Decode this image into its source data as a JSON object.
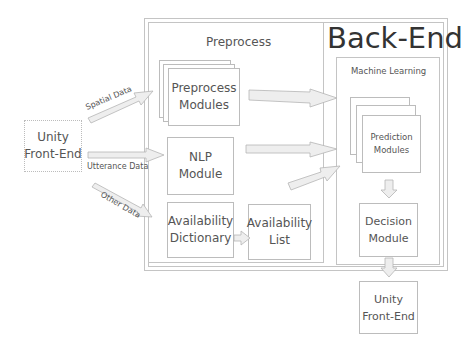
{
  "diagram": {
    "backend_title": "Back-End",
    "preprocess_title": "Preprocess",
    "ml_title": "Machine Learning",
    "nodes": {
      "unity_left": "Unity\nFront-End",
      "preprocess_modules": "Preprocess\nModules",
      "nlp_module": "NLP\nModule",
      "availability_dictionary": "Availability\nDictionary",
      "availability_list": "Availability\nList",
      "prediction_modules": "Prediction\nModules",
      "decision_module": "Decision\nModule",
      "unity_bottom": "Unity\nFront-End"
    },
    "edges": {
      "spatial": "Spatial Data",
      "utterance": "Utterance Data",
      "other": "Other Data"
    },
    "colors": {
      "line": "#bcbcbc",
      "arrow_fill": "#eeeeee",
      "text": "#555555"
    }
  }
}
